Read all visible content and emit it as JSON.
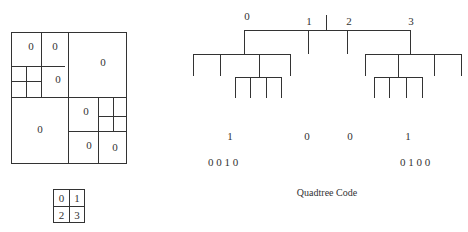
{
  "quadtree_grid": {
    "cells": [
      {
        "label": "0",
        "x": 31,
        "y": 50
      },
      {
        "label": "0",
        "x": 55,
        "y": 50
      },
      {
        "label": "0",
        "x": 58,
        "y": 83
      },
      {
        "label": "0",
        "x": 103,
        "y": 66
      },
      {
        "label": "0",
        "x": 40,
        "y": 133
      },
      {
        "label": "0",
        "x": 86,
        "y": 115
      },
      {
        "label": "0",
        "x": 89,
        "y": 149
      },
      {
        "label": "0",
        "x": 115,
        "y": 151
      }
    ]
  },
  "quadrant_key": {
    "cells": [
      "0",
      "1",
      "2",
      "3"
    ]
  },
  "tree": {
    "top_labels": [
      {
        "label": "0",
        "x": 247,
        "y": 20
      },
      {
        "label": "1",
        "x": 309,
        "y": 25
      },
      {
        "label": "2",
        "x": 349,
        "y": 25
      },
      {
        "label": "3",
        "x": 411,
        "y": 25
      }
    ]
  },
  "code": {
    "level1": [
      {
        "label": "1",
        "x": 230
      },
      {
        "label": "0",
        "x": 307
      },
      {
        "label": "0",
        "x": 350
      },
      {
        "label": "1",
        "x": 408
      }
    ],
    "level2_left": "0 0 1 0",
    "level2_right": "0 1 0 0",
    "caption": "Quadtree Code"
  }
}
